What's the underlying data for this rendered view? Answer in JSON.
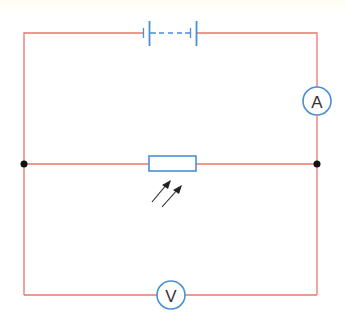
{
  "diagram": {
    "type": "circuit",
    "colors": {
      "wire": "#e8776a",
      "component": "#4a8fd4",
      "junction": "#111111",
      "arrow": "#222222",
      "label": "#333333"
    },
    "components": {
      "battery": {
        "kind": "multi-cell battery",
        "dashed_between_cells": true
      },
      "ammeter": {
        "kind": "ammeter",
        "label": "A"
      },
      "ldr": {
        "kind": "light dependent resistor",
        "light_arrows": 2
      },
      "voltmeter": {
        "kind": "voltmeter",
        "label": "V"
      }
    },
    "junctions": 2
  }
}
